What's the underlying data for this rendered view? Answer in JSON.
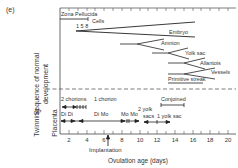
{
  "panel_label": "(e)",
  "y_labels": {
    "upper_line1": "Sequence of normal",
    "upper_line2": "development",
    "lower_twinning": "Twinning",
    "lower_placenta": "Placenta"
  },
  "development": {
    "zona_pellucida": "Zona Pellucida",
    "cells": "Cells",
    "cell_counts": "1 5 8",
    "embryo": "Embryo",
    "amnion": "Amnion",
    "yolk_sac": "Yolk sac",
    "allantois": "Allantois",
    "vessels": "Vessels",
    "primitive_streak": "Primitive streak"
  },
  "twinning": {
    "two_chorions": "2 chorions",
    "one_chorion": "1 chorion",
    "conjoined": "Conjoined",
    "di_di": "Di Di",
    "di_mo": "Di Mo",
    "mo_mo": "Mo Mo",
    "two_yolk_sacs_line1": "2 yolk",
    "two_yolk_sacs_line2": "sacs",
    "one_yolk_sac": "1 yolk sac"
  },
  "x_axis": {
    "ticks": [
      "2",
      "4",
      "6",
      "8",
      "10",
      "12",
      "14",
      "16",
      "18",
      "20"
    ],
    "implantation": "Implantation",
    "title": "Ovulation age (days)"
  }
}
